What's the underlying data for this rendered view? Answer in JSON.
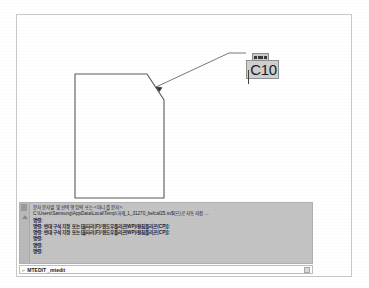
{
  "document": {
    "app": "AutoCAD",
    "drawing_title": "chamfered-rectangle-drawing"
  },
  "drawing": {
    "shape_name": "chamfered rectangle",
    "chamfer_label": "C10",
    "leader_annotation": "C10",
    "mtext_editor": {
      "value": "C10",
      "placeholder": "C10",
      "toolbar_name": "mtext-mini-toolbar"
    },
    "geometry": {
      "rect_left": 74,
      "rect_top": 73,
      "rect_right": 207,
      "rect_bottom": 196,
      "chamfer_x": 162,
      "chamfer_y": 110,
      "leader_tip_x": 181,
      "leader_tip_y": 89,
      "leader_elbow_x": 228,
      "leader_elbow_y": 52
    }
  },
  "command_window": {
    "history": [
      "문자 문자열 및 선택 행 입력 또는 <아니 를 문자>:",
      "C:\\Users\\Samsung\\AppData\\Local\\Temp\\과제_1_31270_befcaf25.sv$(으)로 자동 저장 ...",
      "명령:",
      "명령: 반대 구석 지정 또는 [울타리(F)/윈도우폴리곤(WP)/걸침폴리곤(CP)]:",
      "명령: 반대 구석 지정 또는 [울타리(F)/윈도우폴리곤(WP)/걸침폴리곤(CP)]:",
      "명령:",
      "명령:",
      "명령:"
    ],
    "bold_flags": [
      false,
      false,
      true,
      true,
      true,
      true,
      true,
      true
    ],
    "input": {
      "prompt_icon": "›-",
      "value": "MTEDIT _mtedit",
      "placeholder": "명령 입력"
    },
    "settings_icon": "gear-icon"
  },
  "colors": {
    "page_background": "#ffffff",
    "frame_border": "#c8c8c8",
    "command_panel_background": "#c3c3c3",
    "geometry_stroke": "#5a5a5a",
    "mtext_box_background": "#cfcfcf",
    "text": "#1a1a2e"
  }
}
